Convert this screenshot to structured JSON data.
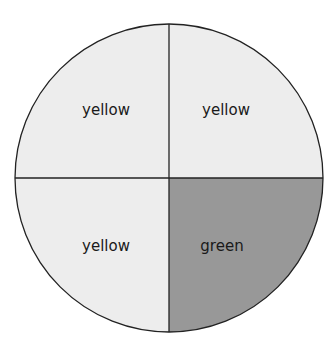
{
  "diagram": {
    "shape": "circle",
    "center": [
      169,
      178
    ],
    "radius": 154,
    "quadrants": [
      {
        "position": "top-left",
        "label": "yellow",
        "fill": "#ededed"
      },
      {
        "position": "top-right",
        "label": "yellow",
        "fill": "#ededed"
      },
      {
        "position": "bottom-left",
        "label": "yellow",
        "fill": "#ededed"
      },
      {
        "position": "bottom-right",
        "label": "green",
        "fill": "#989898"
      }
    ],
    "stroke": "#222222"
  }
}
